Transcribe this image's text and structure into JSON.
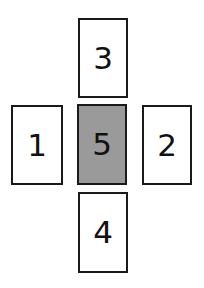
{
  "diagram": {
    "background_color": "#ffffff",
    "border_color": "#1a1a1a",
    "text_color": "#111111",
    "highlight_fill": "#9a9a9a",
    "default_fill": "#ffffff",
    "cards": [
      {
        "id": "card-top",
        "label": "3",
        "position": "top",
        "fill": "#ffffff",
        "highlighted": false
      },
      {
        "id": "card-left",
        "label": "1",
        "position": "left",
        "fill": "#ffffff",
        "highlighted": false
      },
      {
        "id": "card-center",
        "label": "5",
        "position": "center",
        "fill": "#9a9a9a",
        "highlighted": true
      },
      {
        "id": "card-right",
        "label": "2",
        "position": "right",
        "fill": "#ffffff",
        "highlighted": false
      },
      {
        "id": "card-bottom",
        "label": "4",
        "position": "bottom",
        "fill": "#ffffff",
        "highlighted": false
      }
    ]
  }
}
